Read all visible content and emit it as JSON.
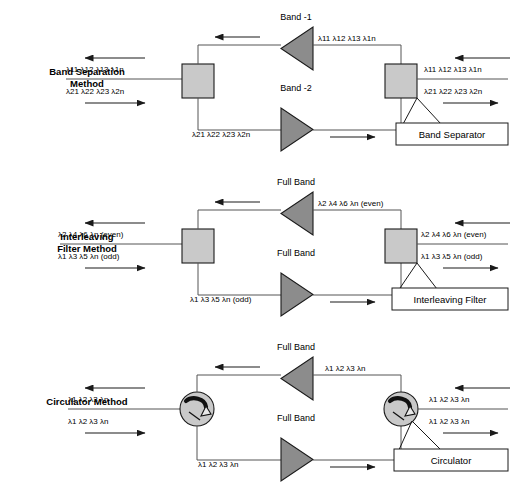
{
  "diagram": {
    "colors": {
      "box_fill": "#c9c9c9",
      "triangle_fill": "#8c8c8c",
      "stroke": "#1a1a1a",
      "background": "#ffffff"
    },
    "sections": [
      {
        "id": "band-separation",
        "method_label_line1": "Band Separation",
        "method_label_line2": "Method",
        "device_name": "Band Separator",
        "device_type": "box",
        "top_band_label": "Band -1",
        "bottom_band_label": "Band -2",
        "left_upper_lambda": "λ11  λ12  λ13  λ1n",
        "left_lower_lambda": "λ21  λ22  λ23  λ2n",
        "right_upper_lambda": "λ11  λ12  λ13  λ1n",
        "right_lower_lambda": "λ21  λ22  λ23  λ2n",
        "top_path_lambda": "λ11  λ12  λ13  λ1n",
        "bottom_path_lambda": "λ21  λ22  λ23  λ2n"
      },
      {
        "id": "interleaving-filter",
        "method_label_line1": "Interleaving",
        "method_label_line2": "Filter Method",
        "device_name": "Interleaving Filter",
        "device_type": "box",
        "top_band_label": "Full Band",
        "bottom_band_label": "Full Band",
        "left_upper_lambda": "λ2  λ4  λ6  λn (even)",
        "left_lower_lambda": "λ1  λ3  λ5  λn (odd)",
        "right_upper_lambda": "λ2  λ4  λ6  λn (even)",
        "right_lower_lambda": "λ1  λ3  λ5  λn (odd)",
        "top_path_lambda": "λ2  λ4  λ6  λn (even)",
        "bottom_path_lambda": "λ1  λ3  λ5  λn (odd)"
      },
      {
        "id": "circulator",
        "method_label_line1": "Circulator Method",
        "method_label_line2": "",
        "device_name": "Circulator",
        "device_type": "circle",
        "top_band_label": "Full Band",
        "bottom_band_label": "Full Band",
        "left_upper_lambda": "λ1  λ2  λ3  λn",
        "left_lower_lambda": "λ1  λ2  λ3  λn",
        "right_upper_lambda": "λ1  λ2  λ3  λn",
        "right_lower_lambda": "λ1  λ2  λ3  λn",
        "top_path_lambda": "λ1  λ2  λ3  λn",
        "bottom_path_lambda": "λ1  λ2  λ3  λn"
      }
    ]
  }
}
